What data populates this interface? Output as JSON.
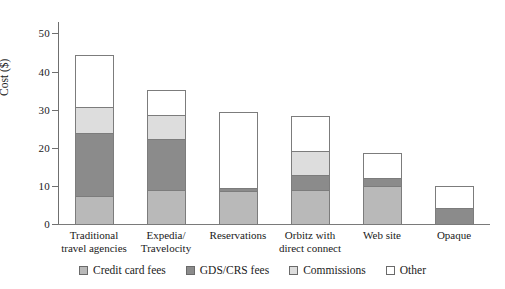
{
  "chart_data": {
    "type": "bar",
    "subtype": "stacked",
    "title": "",
    "xlabel": "",
    "ylabel": "Cost ($)",
    "ylim": [
      0,
      53
    ],
    "yticks": [
      0,
      10,
      20,
      30,
      40,
      50
    ],
    "ytick_labels": [
      "0",
      "10",
      "20",
      "30",
      "40",
      "50"
    ],
    "grid": false,
    "legend_position": "bottom",
    "categories": [
      "Traditional travel agencies",
      "Expedia/ Travelocity",
      "Reservations",
      "Orbitz with direct connect",
      "Web site",
      "Opaque"
    ],
    "category_lines": [
      [
        "Traditional",
        "travel agencies"
      ],
      [
        "Expedia/",
        "Travelocity"
      ],
      [
        "Reservations"
      ],
      [
        "Orbitz with",
        "direct connect"
      ],
      [
        "Web site"
      ],
      [
        "Opaque"
      ]
    ],
    "series": [
      {
        "name": "Credit card fees",
        "color": "#b9b9b9",
        "values": [
          7.0,
          8.7,
          8.5,
          8.7,
          9.7,
          0.0
        ]
      },
      {
        "name": "GDS/CRS fees",
        "color": "#8b8b8b",
        "values": [
          16.5,
          13.3,
          0.7,
          3.8,
          2.0,
          4.0
        ]
      },
      {
        "name": "Commissions",
        "color": "#dddddd",
        "values": [
          7.0,
          6.3,
          0.0,
          6.3,
          0.0,
          0.0
        ]
      },
      {
        "name": "Other",
        "color": "#ffffff",
        "values": [
          13.5,
          6.7,
          19.8,
          9.2,
          6.8,
          5.8
        ]
      }
    ],
    "totals": [
      44.0,
      35.0,
      29.0,
      28.0,
      18.5,
      9.8
    ]
  },
  "legend": {
    "items": [
      {
        "label": "Credit card fees",
        "color": "#b9b9b9"
      },
      {
        "label": "GDS/CRS fees",
        "color": "#8b8b8b"
      },
      {
        "label": "Commissions",
        "color": "#dddddd"
      },
      {
        "label": "Other",
        "color": "#ffffff"
      }
    ]
  },
  "axis": {
    "y_title": "Cost ($)"
  }
}
